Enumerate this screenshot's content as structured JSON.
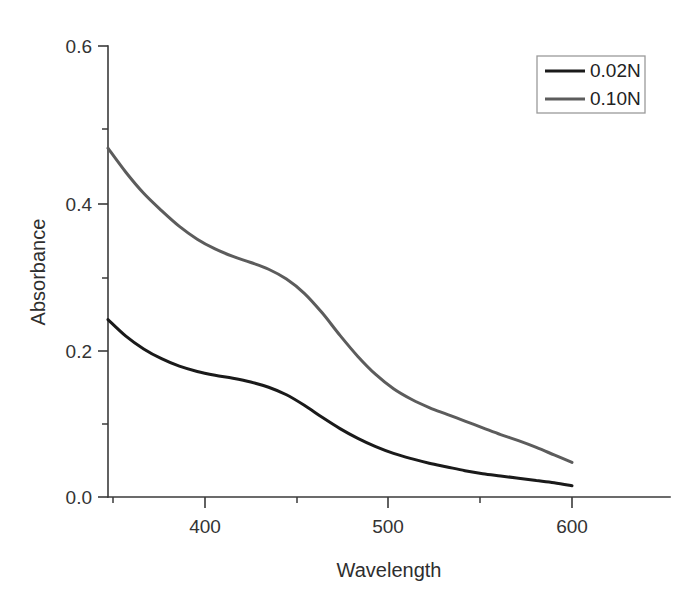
{
  "figure": {
    "background_color": "#ffffff",
    "axis_color": "#3a3a3a"
  },
  "chart_data": {
    "type": "line",
    "title": "",
    "subtitle": "",
    "xlabel": "Wavelength",
    "ylabel": "Absorbance",
    "xlim": [
      340,
      640
    ],
    "ylim": [
      0.0,
      0.6
    ],
    "xticks": [
      400,
      500,
      600
    ],
    "xtick_labels": [
      "400",
      "500",
      "600"
    ],
    "xticks_minor": [
      350,
      450,
      550
    ],
    "yticks": [
      0.0,
      0.2,
      0.4,
      0.6
    ],
    "ytick_labels": [
      "0.0",
      "0.2",
      "0.4",
      "0.6"
    ],
    "yticks_minor": [
      0.1,
      0.3,
      0.5
    ],
    "grid": false,
    "legend_position": "top-right",
    "x": [
      340,
      350,
      360,
      370,
      380,
      390,
      400,
      410,
      420,
      430,
      440,
      450,
      460,
      470,
      480,
      490,
      500,
      510,
      520,
      530,
      540,
      550,
      560,
      570,
      580,
      590,
      600
    ],
    "series": [
      {
        "name": "0.02N",
        "color": "#1a1a1a",
        "linewidth": 3.0,
        "values": [
          0.236,
          0.214,
          0.197,
          0.184,
          0.174,
          0.167,
          0.162,
          0.158,
          0.153,
          0.146,
          0.136,
          0.122,
          0.106,
          0.091,
          0.078,
          0.067,
          0.058,
          0.051,
          0.045,
          0.04,
          0.035,
          0.031,
          0.028,
          0.025,
          0.022,
          0.019,
          0.015
        ]
      },
      {
        "name": "0.10N",
        "color": "#5c5c5c",
        "linewidth": 3.0,
        "values": [
          0.464,
          0.432,
          0.404,
          0.381,
          0.36,
          0.343,
          0.33,
          0.32,
          0.312,
          0.303,
          0.29,
          0.271,
          0.245,
          0.215,
          0.187,
          0.163,
          0.144,
          0.13,
          0.119,
          0.11,
          0.101,
          0.092,
          0.083,
          0.075,
          0.066,
          0.056,
          0.046
        ]
      }
    ],
    "annotations": []
  },
  "legend": {
    "entries": [
      {
        "label": "0.02N",
        "color": "#1a1a1a"
      },
      {
        "label": "0.10N",
        "color": "#5c5c5c"
      }
    ]
  }
}
